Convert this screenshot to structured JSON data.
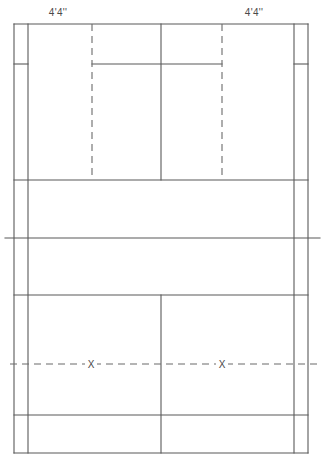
{
  "diagram": {
    "line_color": "#595959",
    "dash_color": "#6b6b6b",
    "background": "#ffffff",
    "labels": [
      {
        "name": "left-width-label",
        "text": "4'4''",
        "x": 58,
        "y": 8
      },
      {
        "name": "right-width-label",
        "text": "4'4''",
        "x": 254,
        "y": 8
      }
    ],
    "marks": [
      {
        "name": "position-mark-left",
        "text": "X",
        "x": 91,
        "y": 364
      },
      {
        "name": "position-mark-right",
        "text": "X",
        "x": 222,
        "y": 364
      }
    ],
    "solid_lines": [
      {
        "name": "outer-boundary-top",
        "x1": 14,
        "y1": 24,
        "x2": 308,
        "y2": 24
      },
      {
        "name": "outer-boundary-bottom",
        "x1": 14,
        "y1": 453,
        "x2": 308,
        "y2": 453
      },
      {
        "name": "outer-boundary-left",
        "x1": 14,
        "y1": 24,
        "x2": 14,
        "y2": 453
      },
      {
        "name": "outer-boundary-right",
        "x1": 308,
        "y1": 24,
        "x2": 308,
        "y2": 453
      },
      {
        "name": "sideline-singles-left",
        "x1": 28,
        "y1": 24,
        "x2": 28,
        "y2": 453
      },
      {
        "name": "sideline-singles-right",
        "x1": 294,
        "y1": 24,
        "x2": 294,
        "y2": 453
      },
      {
        "name": "doubles-long-service-line-top-left",
        "x1": 14,
        "y1": 64,
        "x2": 28,
        "y2": 64
      },
      {
        "name": "doubles-long-service-line-top-right",
        "x1": 294,
        "y1": 64,
        "x2": 308,
        "y2": 64
      },
      {
        "name": "long-service-line-top",
        "x1": 92,
        "y1": 64,
        "x2": 222,
        "y2": 64
      },
      {
        "name": "short-service-line-top",
        "x1": 14,
        "y1": 180,
        "x2": 308,
        "y2": 180
      },
      {
        "name": "net-line",
        "x1": 5,
        "y1": 238,
        "x2": 320,
        "y2": 238
      },
      {
        "name": "short-service-line-bottom",
        "x1": 14,
        "y1": 295,
        "x2": 308,
        "y2": 295
      },
      {
        "name": "long-service-line-bottom",
        "x1": 14,
        "y1": 415,
        "x2": 308,
        "y2": 415
      },
      {
        "name": "center-line-top",
        "x1": 161,
        "y1": 24,
        "x2": 161,
        "y2": 180
      },
      {
        "name": "center-line-bottom",
        "x1": 161,
        "y1": 295,
        "x2": 161,
        "y2": 453
      }
    ],
    "dashed_lines": [
      {
        "name": "service-court-divider-left",
        "x1": 92,
        "y1": 24,
        "x2": 92,
        "y2": 180
      },
      {
        "name": "service-court-divider-right",
        "x1": 222,
        "y1": 24,
        "x2": 222,
        "y2": 180
      },
      {
        "name": "player-position-line",
        "x1": 10,
        "y1": 364,
        "x2": 322,
        "y2": 364
      }
    ]
  }
}
